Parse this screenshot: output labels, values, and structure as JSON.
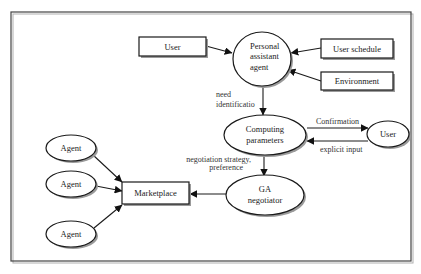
{
  "diagram": {
    "type": "flow-diagram",
    "nodes": {
      "user_top": {
        "label": "User",
        "shape": "rectangle"
      },
      "personal_assistant": {
        "label_lines": [
          "Personal",
          "assistant",
          "agent"
        ],
        "shape": "ellipse"
      },
      "user_schedule": {
        "label": "User schedule",
        "shape": "rectangle"
      },
      "environment": {
        "label": "Environment",
        "shape": "rectangle"
      },
      "computing_parameters": {
        "label_lines": [
          "Computing",
          "parameters"
        ],
        "shape": "ellipse"
      },
      "user_right": {
        "label": "User",
        "shape": "ellipse"
      },
      "ga_negotiator": {
        "label_lines": [
          "GA",
          "negotiator"
        ],
        "shape": "ellipse"
      },
      "marketplace": {
        "label": "Marketplace",
        "shape": "rectangle"
      },
      "agent_1": {
        "label": "Agent",
        "shape": "ellipse"
      },
      "agent_2": {
        "label": "Agent",
        "shape": "ellipse"
      },
      "agent_3": {
        "label": "Agent",
        "shape": "ellipse"
      }
    },
    "edges": [
      {
        "from": "User",
        "to": "Personal assistant agent",
        "label": ""
      },
      {
        "from": "User schedule",
        "to": "Personal assistant agent",
        "label": ""
      },
      {
        "from": "Environment",
        "to": "Personal assistant agent",
        "label": ""
      },
      {
        "from": "Personal assistant agent",
        "to": "Computing parameters",
        "label": "need identificatio"
      },
      {
        "from": "Computing parameters",
        "to": "User",
        "label": "Confirmation"
      },
      {
        "from": "User",
        "to": "Computing parameters",
        "label": "explicit input"
      },
      {
        "from": "Computing parameters",
        "to": "GA negotiator",
        "label": "negotiation strategy, preference"
      },
      {
        "from": "GA negotiator",
        "to": "Marketplace",
        "label": ""
      },
      {
        "from": "Agent",
        "to": "Marketplace",
        "label": ""
      },
      {
        "from": "Agent",
        "to": "Marketplace",
        "label": ""
      },
      {
        "from": "Agent",
        "to": "Marketplace",
        "label": ""
      }
    ],
    "edge_labels": {
      "need_line1": "need",
      "need_line2": "identificatio",
      "confirmation": "Confirmation",
      "explicit_input": "explicit input",
      "strategy_line1": "negotiation strategy,",
      "strategy_line2": "preference"
    }
  }
}
